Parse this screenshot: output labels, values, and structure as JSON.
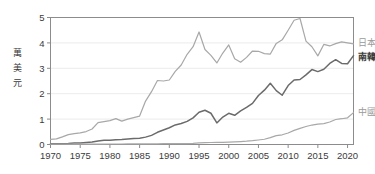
{
  "chart_data": {
    "type": "line",
    "title": "",
    "xlabel": "",
    "ylabel": "萬美元",
    "ylabel_chars": [
      "萬",
      "美",
      "元"
    ],
    "xlim": [
      1970,
      2021
    ],
    "ylim": [
      0,
      5
    ],
    "grid": true,
    "legend_position": "right-inline",
    "x_ticks": [
      "1970",
      "1975",
      "1980",
      "1985",
      "1990",
      "1995",
      "2000",
      "2005",
      "2010",
      "2015",
      "2020"
    ],
    "x_tick_values": [
      1970,
      1975,
      1980,
      1985,
      1990,
      1995,
      2000,
      2005,
      2010,
      2015,
      2020
    ],
    "y_ticks": [
      "0",
      "1",
      "2",
      "3",
      "4",
      "5"
    ],
    "y_tick_values": [
      0,
      1,
      2,
      3,
      4,
      5
    ],
    "x": [
      1970,
      1971,
      1972,
      1973,
      1974,
      1975,
      1976,
      1977,
      1978,
      1979,
      1980,
      1981,
      1982,
      1983,
      1984,
      1985,
      1986,
      1987,
      1988,
      1989,
      1990,
      1991,
      1992,
      1993,
      1994,
      1995,
      1996,
      1997,
      1998,
      1999,
      2000,
      2001,
      2002,
      2003,
      2004,
      2005,
      2006,
      2007,
      2008,
      2009,
      2010,
      2011,
      2012,
      2013,
      2014,
      2015,
      2016,
      2017,
      2018,
      2019,
      2020,
      2021
    ],
    "series": [
      {
        "name": "日本",
        "label": "日本",
        "color": "#a8a8a8",
        "values": [
          0.2,
          0.22,
          0.3,
          0.39,
          0.43,
          0.46,
          0.51,
          0.61,
          0.86,
          0.9,
          0.94,
          1.02,
          0.92,
          1.0,
          1.06,
          1.12,
          1.71,
          2.08,
          2.52,
          2.5,
          2.54,
          2.88,
          3.13,
          3.55,
          3.85,
          4.43,
          3.74,
          3.51,
          3.21,
          3.6,
          3.92,
          3.38,
          3.24,
          3.43,
          3.68,
          3.67,
          3.58,
          3.56,
          3.98,
          4.12,
          4.5,
          4.89,
          4.96,
          4.07,
          3.85,
          3.49,
          3.94,
          3.88,
          3.97,
          4.04,
          4.0,
          3.96
        ]
      },
      {
        "name": "南韓",
        "label": "南韓",
        "color": "#6b6b6b",
        "values": [
          0.03,
          0.03,
          0.03,
          0.04,
          0.06,
          0.06,
          0.08,
          0.1,
          0.14,
          0.17,
          0.17,
          0.19,
          0.2,
          0.22,
          0.24,
          0.25,
          0.29,
          0.36,
          0.48,
          0.57,
          0.66,
          0.77,
          0.83,
          0.91,
          1.05,
          1.27,
          1.35,
          1.23,
          0.85,
          1.08,
          1.23,
          1.15,
          1.32,
          1.46,
          1.62,
          1.93,
          2.14,
          2.41,
          2.12,
          1.94,
          2.32,
          2.54,
          2.56,
          2.74,
          2.95,
          2.87,
          2.96,
          3.19,
          3.34,
          3.19,
          3.18,
          3.5
        ]
      },
      {
        "name": "中國",
        "label": "中國",
        "color": "#a8a8a8",
        "values": [
          0.011,
          0.012,
          0.013,
          0.016,
          0.016,
          0.018,
          0.016,
          0.018,
          0.016,
          0.018,
          0.019,
          0.02,
          0.02,
          0.023,
          0.025,
          0.029,
          0.028,
          0.025,
          0.028,
          0.031,
          0.032,
          0.033,
          0.037,
          0.038,
          0.047,
          0.061,
          0.071,
          0.078,
          0.083,
          0.087,
          0.096,
          0.105,
          0.115,
          0.129,
          0.149,
          0.177,
          0.208,
          0.271,
          0.348,
          0.382,
          0.452,
          0.556,
          0.634,
          0.708,
          0.766,
          0.805,
          0.825,
          0.885,
          0.985,
          1.015,
          1.051,
          1.255
        ]
      }
    ],
    "annotations": [
      {
        "text": "日本",
        "series": "日本"
      },
      {
        "text": "南韓",
        "series": "南韓"
      },
      {
        "text": "中國",
        "series": "中國"
      }
    ]
  },
  "legend": {
    "japan": "日本",
    "korea": "南韓",
    "china": "中國"
  },
  "axis": {
    "y_title": "萬美元"
  },
  "colors": {
    "japan_line": "#a8a8a8",
    "korea_line": "#6b6b6b",
    "china_line": "#a8a8a8",
    "axis": "#8c8c8c",
    "grid": "#e6e6e6",
    "text": "#3b3b3b"
  }
}
